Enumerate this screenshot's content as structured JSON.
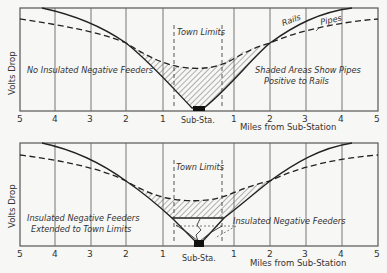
{
  "x_axis": {
    "label": "Miles from Sub-Station",
    "left_ticks": [
      "5",
      "4",
      "3",
      "2",
      "1"
    ],
    "right_ticks": [
      "1",
      "2",
      "3",
      "4",
      "5"
    ],
    "center_label": "Sub-Sta."
  },
  "y_axis": {
    "label": "Volts Drop"
  },
  "panels": [
    {
      "id": "top",
      "left_note": "No Insulated Negative Feeders",
      "right_note_line1": "Shaded Areas Show Pipes",
      "right_note_line2": "Positive to Rails",
      "town_limits_label": "Town Limits",
      "rails_label": "Rails",
      "pipes_label": "Pipes"
    },
    {
      "id": "bottom",
      "left_note_line1": "Insulated Negative Feeders",
      "left_note_line2": "Extended to Town Limits",
      "town_limits_label": "Town Limits",
      "feeder_label": "Insulated Negative Feeders"
    }
  ],
  "colors": {
    "line": "#222222",
    "frame": "#555555",
    "background": "#f7f7f5",
    "substation": "#111111"
  }
}
